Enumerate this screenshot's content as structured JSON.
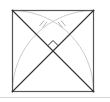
{
  "figure": {
    "type": "geometry-diagram",
    "square": {
      "x": 12.5,
      "y": 10.5,
      "size": 81
    },
    "colors": {
      "outline": "#555555",
      "diagonals": "#333333",
      "arcs": "#c8c8c8",
      "ticks": "#b0b0b0",
      "right_angle": "#333333",
      "background": "#ffffff"
    },
    "marks": {
      "right_angle_at_center": true,
      "double_tick_marks": 2
    }
  }
}
